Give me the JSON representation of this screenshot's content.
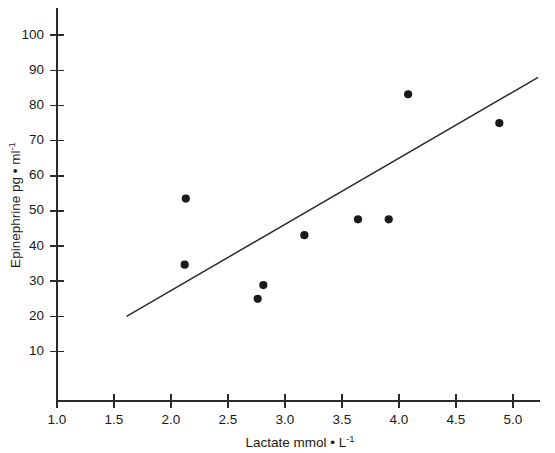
{
  "chart_data": {
    "type": "scatter",
    "title": "",
    "xlabel": "Lactate mmol • L-1",
    "ylabel": "Epinephrine pg • ml-1",
    "xlabel_base": "Lactate mmol • L",
    "xlabel_exp": "-1",
    "ylabel_base": "Epinephrine pg • ml",
    "ylabel_exp": "-1",
    "xlim": [
      1.0,
      5.25
    ],
    "ylim": [
      0,
      107
    ],
    "xticks": [
      1.0,
      1.5,
      2.0,
      2.5,
      3.0,
      3.5,
      4.0,
      4.5,
      5.0
    ],
    "xticklabels": [
      "1.0",
      "1.5",
      "2.0",
      "2.5",
      "3.0",
      "3.5",
      "4.0",
      "4.5",
      "5.0"
    ],
    "yticks": [
      10,
      20,
      30,
      40,
      50,
      60,
      70,
      80,
      90,
      100
    ],
    "yticklabels": [
      "10",
      "20",
      "30",
      "40",
      "50",
      "60",
      "70",
      "80",
      "90",
      "100"
    ],
    "grid": false,
    "legend": "none",
    "marker": "filled-circle",
    "marker_color": "#1a1a1a",
    "line_color": "#2b2b2b",
    "points": [
      {
        "x": 2.13,
        "y": 53.5
      },
      {
        "x": 2.12,
        "y": 34.7
      },
      {
        "x": 2.76,
        "y": 25.0
      },
      {
        "x": 2.81,
        "y": 28.9
      },
      {
        "x": 3.17,
        "y": 43.1
      },
      {
        "x": 3.64,
        "y": 47.6
      },
      {
        "x": 3.91,
        "y": 47.6
      },
      {
        "x": 4.08,
        "y": 83.2
      },
      {
        "x": 4.88,
        "y": 75.0
      }
    ],
    "series": [
      {
        "name": "observations",
        "x": [
          2.13,
          2.12,
          2.76,
          2.81,
          3.17,
          3.64,
          3.91,
          4.08,
          4.88
        ],
        "values": [
          53.5,
          34.7,
          25.0,
          28.9,
          43.1,
          47.6,
          47.6,
          83.2,
          75.0
        ]
      }
    ],
    "regression_line": {
      "name": "least-squares fit",
      "x_start": 1.61,
      "y_start": 20.0,
      "x_end": 5.22,
      "y_end": 88.0
    }
  }
}
